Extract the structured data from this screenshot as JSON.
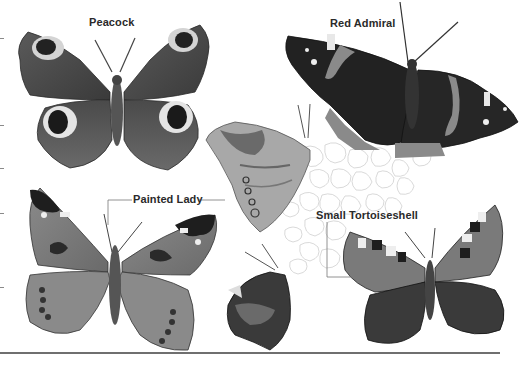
{
  "plate": {
    "labels": {
      "peacock": "Peacock",
      "red_admiral": "Red Admiral",
      "painted_lady": "Painted Lady",
      "small_tortoiseshell": "Small Tortoiseshell"
    },
    "colors": {
      "background": "#ffffff",
      "label_text": "#2a2a2a",
      "leader_line": "#777777",
      "dark_wing": "#1e1e1e",
      "mid_wing": "#6a6a6a",
      "light_wing": "#b4b4b4",
      "flower_outline": "#c8c8c8",
      "bottom_rule": "#6f6f6f"
    },
    "edge_ticks_y": [
      38,
      125,
      168,
      213,
      287
    ]
  }
}
